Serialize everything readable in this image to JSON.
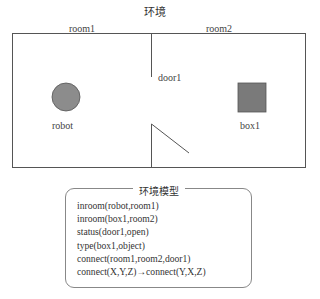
{
  "title": "环境",
  "rooms": {
    "room1_label": "room1",
    "room2_label": "room2"
  },
  "door": {
    "label": "door1"
  },
  "objects": {
    "robot": {
      "label": "robot",
      "shape": "circle",
      "fill": "#8c8c8c"
    },
    "box": {
      "label": "box1",
      "shape": "square",
      "fill": "#7a7a7a"
    }
  },
  "model": {
    "title": "环境模型",
    "facts": [
      "inroom(robot,room1)",
      "inroom(box1,room2)",
      "status(door1,open)",
      "type(box1,object)",
      "connect(room1,room2,door1)",
      "connect(X,Y,Z)→connect(Y,X,Z)"
    ]
  }
}
